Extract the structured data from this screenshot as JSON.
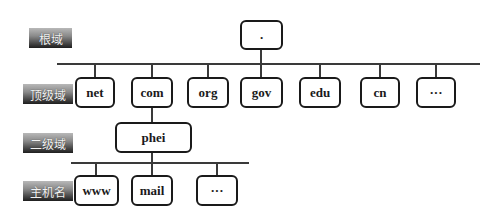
{
  "diagram": {
    "type": "dns-hierarchy-tree",
    "levels": [
      {
        "label": "根域"
      },
      {
        "label": "顶级域"
      },
      {
        "label": "二级域"
      },
      {
        "label": "主机名"
      }
    ],
    "root": {
      "label": "."
    },
    "top_level_domains": [
      {
        "label": "net"
      },
      {
        "label": "com"
      },
      {
        "label": "org"
      },
      {
        "label": "gov"
      },
      {
        "label": "edu"
      },
      {
        "label": "cn"
      },
      {
        "label": "···"
      }
    ],
    "second_level": {
      "label": "phei",
      "parent": "com"
    },
    "hosts": [
      {
        "label": "www"
      },
      {
        "label": "mail"
      },
      {
        "label": "···"
      }
    ]
  },
  "edges": [
    {
      "from": ".",
      "to": "net"
    },
    {
      "from": ".",
      "to": "com"
    },
    {
      "from": ".",
      "to": "org"
    },
    {
      "from": ".",
      "to": "gov"
    },
    {
      "from": ".",
      "to": "edu"
    },
    {
      "from": ".",
      "to": "cn"
    },
    {
      "from": ".",
      "to": "···"
    },
    {
      "from": "com",
      "to": "phei"
    },
    {
      "from": "phei",
      "to": "www"
    },
    {
      "from": "phei",
      "to": "mail"
    },
    {
      "from": "phei",
      "to": "···"
    }
  ],
  "colors": {
    "line": "#3a3a3a",
    "node_border": "#1a1a1a",
    "label_gradient_top": "#b8b8b8",
    "label_gradient_bottom": "#1e1e1e"
  }
}
